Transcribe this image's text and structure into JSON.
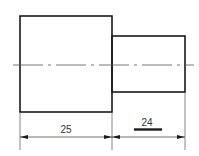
{
  "drawing": {
    "type": "stepped shaft side view",
    "colors": {
      "outline": "#1a1a1a",
      "thin": "#555555",
      "background": "#ffffff"
    },
    "dimensions": [
      {
        "label": "25",
        "segment": "large-cylinder-length"
      },
      {
        "label": "24",
        "segment": "small-cylinder-length",
        "underlined": true
      }
    ]
  }
}
